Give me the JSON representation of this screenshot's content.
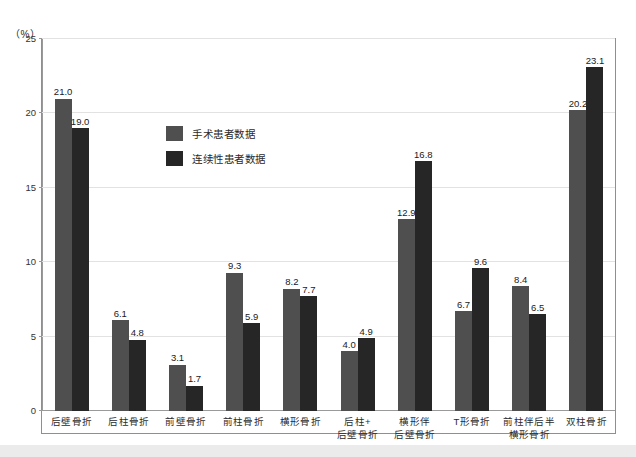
{
  "chart_data": {
    "type": "bar",
    "title": "",
    "subtitle": "",
    "xlabel": "",
    "ylabel": "",
    "unit_label": "（%）",
    "ylim": [
      0,
      25
    ],
    "yticks": [
      0,
      5,
      10,
      15,
      20,
      25
    ],
    "ytick_labels": [
      "0",
      "5",
      "10",
      "15",
      "20",
      "25"
    ],
    "grid": "horizontal",
    "legend_position": "inside-upper-left",
    "categories": [
      "后壁骨折",
      "后柱骨折",
      "前壁骨折",
      "前柱骨折",
      "横形骨折",
      "后柱+后壁骨折",
      "横形伴后壁骨折",
      "T形骨折",
      "前柱伴后半横形骨折",
      "双柱骨折"
    ],
    "category_lines": [
      [
        "后壁骨折"
      ],
      [
        "后柱骨折"
      ],
      [
        "前壁骨折"
      ],
      [
        "前柱骨折"
      ],
      [
        "横形骨折"
      ],
      [
        "后柱+",
        "后壁骨折"
      ],
      [
        "横形伴",
        "后壁骨折"
      ],
      [
        "T形骨折"
      ],
      [
        "前柱伴后半",
        "横形骨折"
      ],
      [
        "双柱骨折"
      ]
    ],
    "series": [
      {
        "name": "手术患者数据",
        "color": "#4f4f4f",
        "values": [
          21.0,
          6.1,
          3.1,
          9.3,
          8.2,
          4.0,
          12.9,
          6.7,
          8.4,
          20.2
        ],
        "value_labels": [
          "21.0",
          "6.1",
          "3.1",
          "9.3",
          "8.2",
          "4.0",
          "12.9",
          "6.7",
          "8.4",
          "20.2"
        ]
      },
      {
        "name": "连续性患者数据",
        "color": "#262626",
        "values": [
          19.0,
          4.8,
          1.7,
          5.9,
          7.7,
          4.9,
          16.8,
          9.6,
          6.5,
          23.1
        ],
        "value_labels": [
          "19.0",
          "4.8",
          "1.7",
          "5.9",
          "7.7",
          "4.9",
          "16.8",
          "9.6",
          "6.5",
          "23.1"
        ]
      }
    ]
  },
  "colors": {
    "series_operative": "#4f4f4f",
    "series_consecutive": "#262626",
    "gridline": "#e2e2e2",
    "axis": "#9a9a9a",
    "frame": "#8f8f8f",
    "background": "#ffffff"
  },
  "caption": {
    "text": ""
  }
}
